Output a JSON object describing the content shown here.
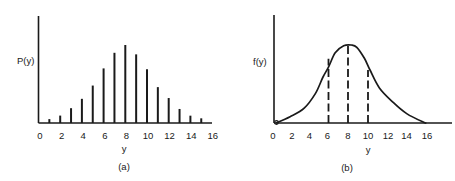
{
  "chart_data": [
    {
      "id": "a",
      "type": "bar",
      "caption": "(a)",
      "title": "",
      "xlabel": "y",
      "ylabel": "P(y)",
      "x_ticks": [
        0,
        2,
        4,
        6,
        8,
        10,
        12,
        14,
        16
      ],
      "xlim": [
        0,
        16
      ],
      "y_ticks": [],
      "grid": false,
      "legend": null,
      "style": "vertical spike lines (probability mass function)",
      "categories": [
        1,
        2,
        3,
        4,
        5,
        6,
        7,
        8,
        9,
        10,
        11,
        12,
        13,
        14,
        15
      ],
      "values": [
        0.05,
        0.095,
        0.19,
        0.31,
        0.48,
        0.7,
        0.9,
        1.0,
        0.88,
        0.69,
        0.46,
        0.32,
        0.18,
        0.094,
        0.06
      ],
      "values_note": "relative heights, P(8) normalized to 1.0 (no y-axis scale shown)"
    },
    {
      "id": "b",
      "type": "line",
      "caption": "(b)",
      "title": "",
      "xlabel": "y",
      "ylabel": "f(y)",
      "x_ticks": [
        0,
        2,
        4,
        6,
        8,
        10,
        12,
        14,
        16
      ],
      "xlim": [
        0,
        17.5
      ],
      "y_ticks": [],
      "grid": false,
      "legend": null,
      "style": "smooth bell-shaped density curve with dashed vertical lines",
      "x": [
        0,
        1.5,
        3,
        4.2,
        5,
        5.6,
        6.3,
        7.2,
        8,
        8.6,
        9.4,
        10,
        11,
        12.5,
        13.9,
        15.7,
        16
      ],
      "values": [
        0.0,
        0.08,
        0.19,
        0.38,
        0.59,
        0.72,
        0.9,
        0.99,
        1.0,
        0.97,
        0.83,
        0.68,
        0.45,
        0.26,
        0.12,
        0.01,
        0.0
      ],
      "values_note": "relative density, f(8) normalized to 1.0 (no y-axis scale shown)",
      "dashed_lines_at": [
        6,
        8,
        10
      ],
      "origin_marker": true
    }
  ],
  "labels": {
    "a": {
      "ylabel": "P(y)",
      "xlabel": "y",
      "caption": "(a)",
      "ticks": [
        "0",
        "2",
        "4",
        "6",
        "8",
        "10",
        "12",
        "14",
        "16"
      ]
    },
    "b": {
      "ylabel": "f(y)",
      "xlabel": "y",
      "caption": "(b)",
      "ticks": [
        "0",
        "2",
        "4",
        "6",
        "8",
        "10",
        "12",
        "14",
        "16"
      ]
    }
  },
  "colors": {
    "ink": "#1a1a1a",
    "background": "#ffffff"
  }
}
